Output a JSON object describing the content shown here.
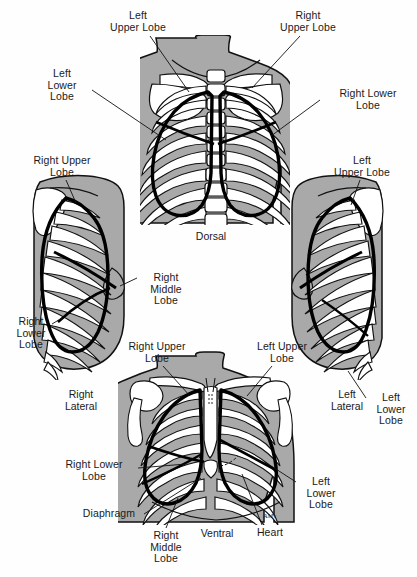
{
  "figure": {
    "background_color": "#ffffff",
    "ink_color": "#1a1a1a",
    "skin_fill": "#a9a9a9",
    "bone_fill": "#ffffff",
    "lung_outline_color": "#000000",
    "artist_signature": "AMy"
  },
  "views": {
    "dorsal": {
      "caption": "Dorsal",
      "labels": {
        "left_upper": "Left\nUpper Lobe",
        "right_upper": "Right\nUpper Lobe",
        "left_lower": "Left\nLower\nLobe",
        "right_lower": "Right Lower\nLobe"
      }
    },
    "right_lateral": {
      "caption": "Right\nLateral",
      "labels": {
        "right_upper": "Right Upper\nLobe",
        "right_middle": "Right\nMiddle\nLobe",
        "right_lower": "Right\nLower\nLobe"
      }
    },
    "left_lateral": {
      "caption": "Left\nLateral",
      "labels": {
        "left_upper": "Left\nUpper Lobe",
        "left_lower": "Left\nLower\nLobe"
      }
    },
    "ventral": {
      "caption": "Ventral",
      "labels": {
        "right_upper": "Right Upper\nLobe",
        "left_upper": "Left Upper\nLobe",
        "right_lower": "Right Lower\nLobe",
        "left_lower": "Left\nLower\nLobe",
        "right_middle": "Right\nMiddle\nLobe",
        "diaphragm": "Diaphragm",
        "heart": "Heart"
      }
    }
  }
}
